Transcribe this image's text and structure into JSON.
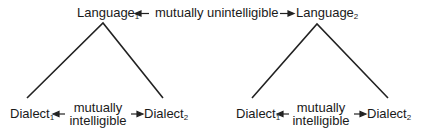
{
  "diagram": {
    "top": {
      "left_label": {
        "base": "Language",
        "sub": "1"
      },
      "relation": "mutually unintelligible",
      "right_label": {
        "base": "Language",
        "sub": "2"
      }
    },
    "trees": [
      {
        "left_label": {
          "base": "Dialect",
          "sub": "1"
        },
        "relation_line1": "mutually",
        "relation_line2": "intelligible",
        "right_label": {
          "base": "Dialect",
          "sub": "2"
        }
      },
      {
        "left_label": {
          "base": "Dialect",
          "sub": "1"
        },
        "relation_line1": "mutually",
        "relation_line2": "intelligible",
        "right_label": {
          "base": "Dialect",
          "sub": "2"
        }
      }
    ],
    "colors": {
      "line": "#222222",
      "text": "#1a1a1a",
      "background": "#ffffff"
    }
  }
}
